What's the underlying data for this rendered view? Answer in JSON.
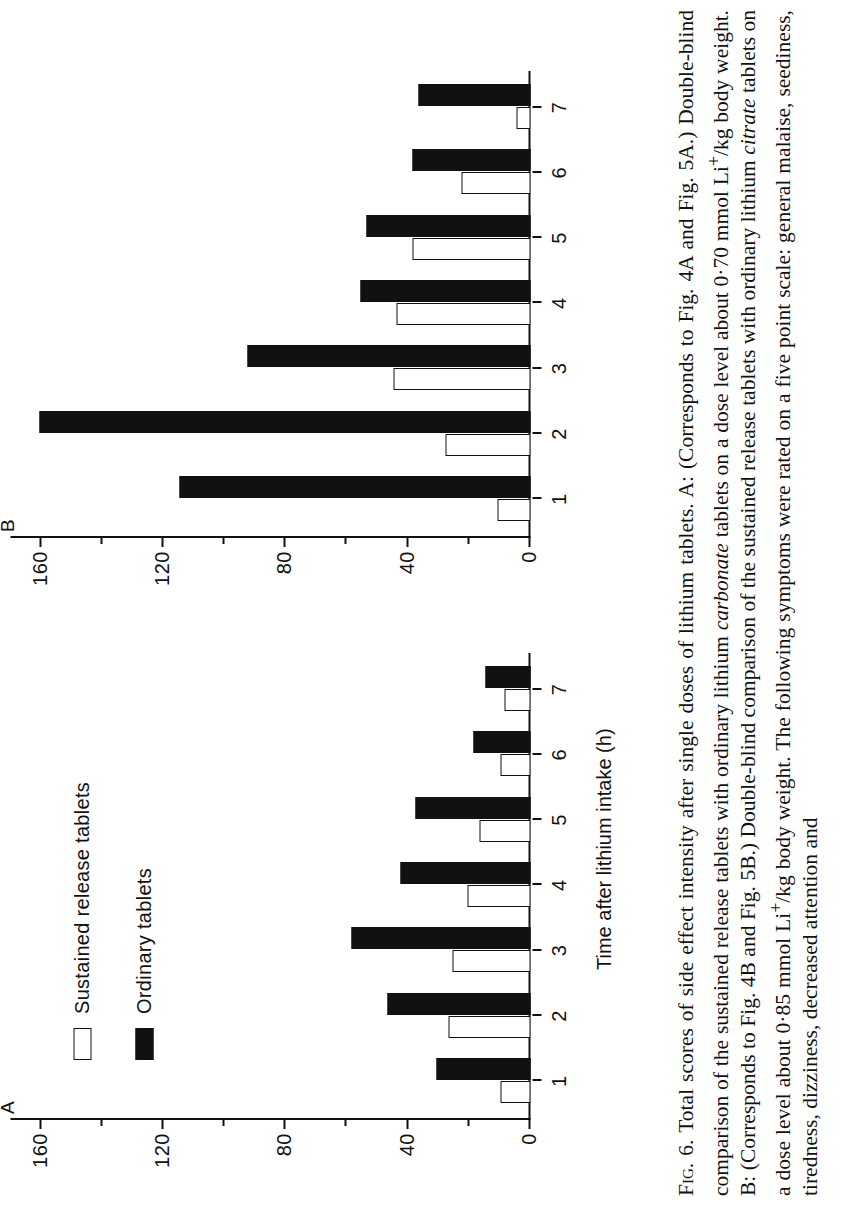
{
  "figure": {
    "panel_labels": {
      "a": "A",
      "b": "B"
    },
    "axis": {
      "x_title": "Time after lithium intake (h)",
      "y_ticks": [
        "0",
        "40",
        "80",
        "120",
        "160"
      ],
      "y_tick_values": [
        0,
        40,
        80,
        120,
        160
      ],
      "y_minor_step": 20,
      "x_ticks": [
        "1",
        "2",
        "3",
        "4",
        "5",
        "6",
        "7"
      ]
    },
    "legend": {
      "items": [
        {
          "label": "Sustained release tablets",
          "fill": "white"
        },
        {
          "label": "Ordinary tablets",
          "fill": "black"
        }
      ]
    }
  },
  "chart_data": [
    {
      "type": "bar",
      "panel": "A",
      "title": "",
      "xlabel": "Time after lithium intake (h)",
      "ylabel": "",
      "categories": [
        "1",
        "2",
        "3",
        "4",
        "5",
        "6",
        "7"
      ],
      "ylim": [
        0,
        170
      ],
      "yticks": [
        0,
        40,
        80,
        120,
        160
      ],
      "grid": false,
      "legend_position": "upper-left-outside",
      "orientation": "vertical",
      "series": [
        {
          "name": "Sustained release tablets",
          "fill": "white",
          "values": [
            9,
            26,
            25,
            20,
            16,
            9,
            8
          ]
        },
        {
          "name": "Ordinary tablets",
          "fill": "black",
          "values": [
            30,
            46,
            58,
            42,
            37,
            18,
            14
          ]
        }
      ]
    },
    {
      "type": "bar",
      "panel": "B",
      "title": "",
      "xlabel": "Time after lithium intake (h)",
      "ylabel": "",
      "categories": [
        "1",
        "2",
        "3",
        "4",
        "5",
        "6",
        "7"
      ],
      "ylim": [
        0,
        170
      ],
      "yticks": [
        0,
        40,
        80,
        120,
        160
      ],
      "grid": false,
      "legend_position": "upper-left-outside",
      "orientation": "vertical",
      "series": [
        {
          "name": "Sustained release tablets",
          "fill": "white",
          "values": [
            10,
            27,
            44,
            43,
            38,
            22,
            4
          ]
        },
        {
          "name": "Ordinary tablets",
          "fill": "black",
          "values": [
            114,
            160,
            92,
            55,
            53,
            38,
            36
          ]
        }
      ]
    }
  ],
  "caption": {
    "fig_label": "Fig. 6.",
    "parts": [
      {
        "t": "Total scores of side effect intensity after single doses of lithium tablets. A: (Corresponds to Fig. 4A and Fig. 5A.) Double-blind comparison of the sustained release tablets with ordinary lithium "
      },
      {
        "t": "carbonate",
        "i": true
      },
      {
        "t": " tablets on a dose level about 0"
      },
      {
        "t": "·"
      },
      {
        "t": "70 mmol Li"
      },
      {
        "t": "+",
        "sup": true
      },
      {
        "t": "/kg body weight. B: (Corresponds to Fig. 4B and Fig. 5B.) Double-blind comparison of the sustained release tablets with ordinary lithium "
      },
      {
        "t": "citrate",
        "i": true
      },
      {
        "t": " tablets on a dose level about 0"
      },
      {
        "t": "·"
      },
      {
        "t": "85 mmol Li"
      },
      {
        "t": "+",
        "sup": true
      },
      {
        "t": "/kg body weight. The following symptoms were rated on a five point scale: general malaise, seediness, tiredness, dizziness, decreased attention and"
      }
    ],
    "text": "Fig. 6. Total scores of side effect intensity after single doses of lithium tablets. A: (Corresponds to Fig. 4A and Fig. 5A.) Double-blind comparison of the sustained release tablets with ordinary lithium carbonate tablets on a dose level about 0·70 mmol Li+/kg body weight. B: (Corresponds to Fig. 4B and Fig. 5B.) Double-blind comparison of the sustained release tablets with ordinary lithium citrate tablets on a dose level about 0·85 mmol Li+/kg body weight. The following symptoms were rated on a five point scale: general malaise, seediness, tiredness, dizziness, decreased attention and"
  },
  "colors": {
    "ink": "#111111",
    "paper": "#ffffff",
    "bar_filled": "#111111",
    "bar_open": "#ffffff"
  }
}
